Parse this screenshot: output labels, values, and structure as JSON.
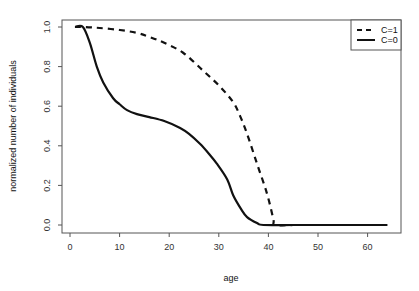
{
  "chart_data": {
    "type": "line",
    "title": "",
    "xlabel": "age",
    "ylabel": "normalized number of individuals",
    "xlim": [
      -1.5,
      65.5
    ],
    "ylim": [
      -0.04,
      1.04
    ],
    "xticks": [
      0,
      10,
      20,
      30,
      40,
      50,
      60
    ],
    "yticks": [
      0.0,
      0.2,
      0.4,
      0.6,
      0.8,
      1.0
    ],
    "xtick_labels": [
      "0",
      "10",
      "20",
      "30",
      "40",
      "50",
      "60"
    ],
    "ytick_labels": [
      "0.0",
      "0.2",
      "0.4",
      "0.6",
      "0.8",
      "1.0"
    ],
    "grid": false,
    "legend_position": "top-right",
    "series": [
      {
        "name": "C=1",
        "style": "dashed",
        "color": "#111111",
        "x": [
          1,
          3,
          6,
          10,
          13.5,
          16,
          19,
          22.8,
          26.8,
          30.2,
          32.9,
          34.3,
          35.7,
          37.7,
          39.7,
          41,
          41.3,
          45,
          50,
          55,
          60,
          64
        ],
        "y": [
          1.0,
          1.0,
          0.995,
          0.985,
          0.97,
          0.95,
          0.92,
          0.87,
          0.78,
          0.7,
          0.62,
          0.55,
          0.46,
          0.31,
          0.16,
          0.03,
          0.0,
          0.0,
          0.0,
          0.0,
          0.0,
          0.0
        ]
      },
      {
        "name": "C=0",
        "style": "solid",
        "color": "#111111",
        "x": [
          1,
          2.6,
          4,
          5.4,
          6.7,
          8.7,
          10,
          11.5,
          13.5,
          16,
          19,
          22.2,
          24,
          26.2,
          28,
          29.6,
          31.7,
          32.9,
          34.5,
          35.7,
          37.7,
          39,
          45,
          50,
          55,
          60,
          64
        ],
        "y": [
          1.0,
          1.0,
          0.92,
          0.8,
          0.72,
          0.64,
          0.61,
          0.58,
          0.56,
          0.545,
          0.525,
          0.49,
          0.46,
          0.41,
          0.36,
          0.31,
          0.23,
          0.15,
          0.08,
          0.04,
          0.01,
          0.0,
          0.0,
          0.0,
          0.0,
          0.0,
          0.0
        ]
      }
    ]
  },
  "legend": {
    "items": [
      {
        "label": "C=1",
        "style": "dashed"
      },
      {
        "label": "C=0",
        "style": "solid"
      }
    ]
  }
}
